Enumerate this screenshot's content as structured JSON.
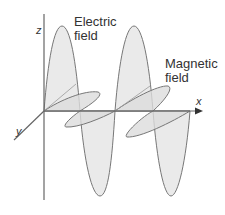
{
  "diagram": {
    "labels": {
      "electric_line1": "Electric",
      "electric_line2": "field",
      "magnetic_line1": "Magnetic",
      "magnetic_line2": "field"
    },
    "axes": {
      "z": "z",
      "x": "x",
      "y": "y"
    },
    "colors": {
      "fill": "#e6e6e6",
      "stroke": "#777777",
      "axis": "#666666"
    }
  }
}
